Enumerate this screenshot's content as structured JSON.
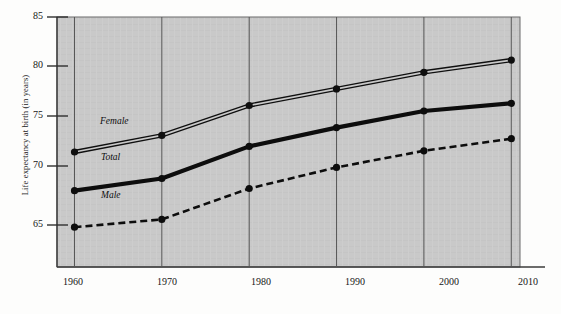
{
  "chart_data": {
    "type": "line",
    "title": "",
    "xlabel": "",
    "ylabel": "Life expectancy at birth (in years)",
    "x": [
      1960,
      1970,
      1980,
      1990,
      2000,
      2010
    ],
    "xticklabels": [
      "1960",
      "1970",
      "1980",
      "1990",
      "2000",
      "2010"
    ],
    "yticklabels": [
      "65",
      "70",
      "75",
      "80",
      "85"
    ],
    "yticks": [
      65,
      70,
      75,
      80,
      85
    ],
    "xlim": [
      1958,
      2011
    ],
    "ylim": [
      62.8,
      85.4
    ],
    "grid": "vertical",
    "legend_position": "inline-labels",
    "plot_background": "#c9c9c9",
    "series": [
      {
        "name": "Female",
        "label": "Female",
        "style": "double-line",
        "color": "#0f0f0f",
        "values": [
          73.2,
          74.7,
          77.4,
          78.9,
          80.4,
          81.5
        ]
      },
      {
        "name": "Total",
        "label": "Total",
        "style": "thick-solid",
        "color": "#0d0d0d",
        "values": [
          69.7,
          70.8,
          73.7,
          75.4,
          76.9,
          77.6
        ]
      },
      {
        "name": "Male",
        "label": "Male",
        "style": "dashed",
        "color": "#0d0d0d",
        "values": [
          66.4,
          67.1,
          69.9,
          71.8,
          73.3,
          74.4
        ]
      }
    ]
  }
}
